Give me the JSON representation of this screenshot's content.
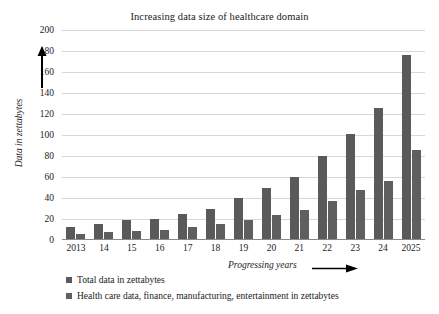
{
  "chart_data": {
    "type": "bar",
    "title": "Increasing data size of healthcare domain",
    "xlabel": "Progressing years",
    "ylabel": "Data in zettabytes",
    "categories": [
      "2013",
      "14",
      "15",
      "16",
      "17",
      "18",
      "19",
      "20",
      "21",
      "22",
      "23",
      "24",
      "2025"
    ],
    "series": [
      {
        "name": "Total data in zettabytes",
        "color": "#5a5a5a",
        "values": [
          12,
          15,
          19,
          20,
          25,
          30,
          40,
          50,
          60,
          80,
          101,
          126,
          176
        ]
      },
      {
        "name": "Health care data, finance, manufacturing, entertainment in zettabytes",
        "color": "#5f5f5f",
        "values": [
          6,
          8,
          9,
          10,
          12,
          15,
          19,
          24,
          29,
          37,
          48,
          56,
          86
        ]
      }
    ],
    "ylim": [
      0,
      200
    ],
    "yticks": [
      0,
      20,
      40,
      60,
      80,
      100,
      120,
      140,
      160,
      180,
      200
    ],
    "grid": true,
    "legend_position": "bottom-left",
    "gridline_color": "#d6d6d6",
    "axis_color": "#8a8a8a"
  }
}
